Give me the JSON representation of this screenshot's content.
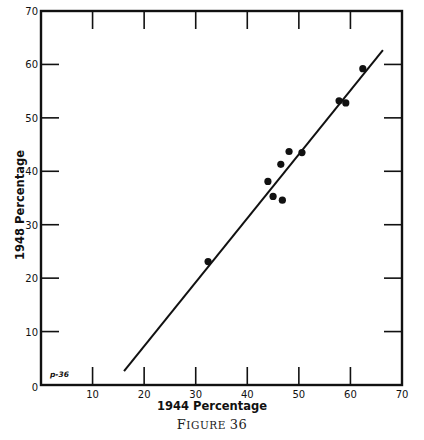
{
  "figure": {
    "caption": "Figure 36"
  },
  "chart_data": {
    "type": "scatter",
    "title": "",
    "caption": "Figure 36",
    "xlabel": "1944 Percentage",
    "ylabel": "1948 Percentage",
    "xlim": [
      0,
      70
    ],
    "ylim": [
      0,
      70
    ],
    "x_ticks": [
      0,
      10,
      20,
      30,
      40,
      50,
      60,
      70
    ],
    "y_ticks": [
      0,
      10,
      20,
      30,
      40,
      50,
      60,
      70
    ],
    "x_tick_labels": [
      "10",
      "20",
      "30",
      "40",
      "50",
      "60",
      "70"
    ],
    "y_tick_labels": [
      "0",
      "10",
      "20",
      "30",
      "40",
      "50",
      "60",
      "70"
    ],
    "grid": false,
    "legend": null,
    "annotation": "p-36",
    "series": [
      {
        "name": "observations",
        "type": "scatter",
        "points": [
          {
            "x": 32.4,
            "y": 23.1
          },
          {
            "x": 44.0,
            "y": 38.1
          },
          {
            "x": 45.0,
            "y": 35.3
          },
          {
            "x": 46.8,
            "y": 34.6
          },
          {
            "x": 46.5,
            "y": 41.3
          },
          {
            "x": 48.1,
            "y": 43.7
          },
          {
            "x": 50.6,
            "y": 43.5
          },
          {
            "x": 57.8,
            "y": 53.2
          },
          {
            "x": 59.1,
            "y": 52.8
          },
          {
            "x": 62.4,
            "y": 59.2
          }
        ]
      },
      {
        "name": "fitted line",
        "type": "line",
        "points": [
          {
            "x": 16.1,
            "y": 2.6
          },
          {
            "x": 66.3,
            "y": 62.7
          }
        ]
      }
    ]
  },
  "style": {
    "ink_color": "#111111",
    "background_color": "#ffffff"
  }
}
